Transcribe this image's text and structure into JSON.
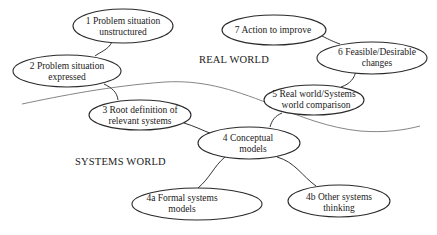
{
  "diagram": {
    "type": "soft-systems-methodology",
    "regions": {
      "real_world": "REAL WORLD",
      "systems_world": "SYSTEMS WORLD"
    },
    "nodes": [
      {
        "id": "1",
        "line1": "1 Problem situation",
        "line2": "unstructured"
      },
      {
        "id": "2",
        "line1": "2 Problem situation",
        "line2": "expressed"
      },
      {
        "id": "3",
        "line1": "3 Root definition of",
        "line2": "relevant systems"
      },
      {
        "id": "4",
        "line1": "4 Conceptual",
        "line2": "models"
      },
      {
        "id": "4a",
        "line1": "4a Formal systems",
        "line2": "models"
      },
      {
        "id": "4b",
        "line1": "4b Other systems",
        "line2": "thinking"
      },
      {
        "id": "5",
        "line1": "5 Real world/Systems",
        "line2": "world comparison"
      },
      {
        "id": "6",
        "line1": "6 Feasible/Desirable",
        "line2": "changes"
      },
      {
        "id": "7",
        "line1": "7 Action to improve",
        "line2": ""
      }
    ],
    "edges": [
      [
        "1",
        "2"
      ],
      [
        "2",
        "3"
      ],
      [
        "3",
        "4"
      ],
      [
        "4",
        "4a"
      ],
      [
        "4",
        "4b"
      ],
      [
        "4",
        "5"
      ],
      [
        "5",
        "6"
      ],
      [
        "6",
        "7"
      ]
    ]
  }
}
